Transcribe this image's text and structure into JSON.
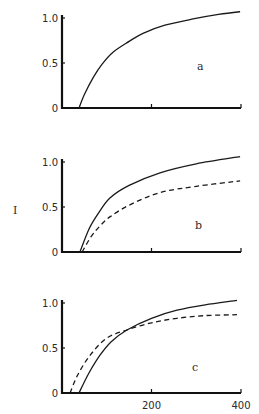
{
  "figure": {
    "y_axis_title": "I",
    "x_tick_labels": [
      "200",
      "400"
    ]
  },
  "chart_data": [
    {
      "type": "line",
      "panel": "a",
      "title": "",
      "xlabel": "",
      "ylabel": "I",
      "xlim": [
        0,
        400
      ],
      "ylim": [
        0,
        1.0
      ],
      "y_ticks": [
        "0",
        "0.5",
        "1.0"
      ],
      "x_ticks": [
        200,
        400
      ],
      "x_tick_labels_shown": false,
      "grid": false,
      "annotation": "a",
      "series": [
        {
          "name": "solid",
          "style": "solid",
          "x": [
            38,
            50,
            70,
            90,
            114,
            150,
            181,
            230,
            293,
            350,
            398
          ],
          "y": [
            0.0,
            0.15,
            0.34,
            0.49,
            0.62,
            0.74,
            0.83,
            0.92,
            0.99,
            1.04,
            1.07
          ]
        }
      ]
    },
    {
      "type": "line",
      "panel": "b",
      "title": "",
      "xlabel": "",
      "ylabel": "I",
      "xlim": [
        0,
        400
      ],
      "ylim": [
        0,
        1.0
      ],
      "y_ticks": [
        "0",
        "0.5",
        "1.0"
      ],
      "x_ticks": [
        200,
        400
      ],
      "x_tick_labels_shown": false,
      "grid": false,
      "annotation": "b",
      "series": [
        {
          "name": "solid",
          "style": "solid",
          "x": [
            40,
            60,
            80,
            107,
            150,
            219,
            300,
            398
          ],
          "y": [
            0.0,
            0.25,
            0.42,
            0.6,
            0.74,
            0.88,
            0.98,
            1.06
          ]
        },
        {
          "name": "dashed",
          "style": "dashed",
          "x": [
            45,
            65,
            85,
            107,
            150,
            219,
            300,
            398
          ],
          "y": [
            0.0,
            0.17,
            0.29,
            0.39,
            0.52,
            0.66,
            0.73,
            0.79
          ]
        }
      ]
    },
    {
      "type": "line",
      "panel": "c",
      "title": "",
      "xlabel": "",
      "ylabel": "I",
      "xlim": [
        0,
        400
      ],
      "ylim": [
        0,
        1.0
      ],
      "y_ticks": [
        "0",
        "0.5",
        "1.0"
      ],
      "x_ticks": [
        200,
        400
      ],
      "x_tick_labels_shown": true,
      "grid": false,
      "annotation": "c",
      "series": [
        {
          "name": "solid",
          "style": "solid",
          "x": [
            38,
            60,
            85,
            110,
            145,
            200,
            257,
            320,
            391
          ],
          "y": [
            0.0,
            0.22,
            0.42,
            0.57,
            0.7,
            0.83,
            0.92,
            0.98,
            1.03
          ]
        },
        {
          "name": "dashed",
          "style": "dashed",
          "x": [
            18,
            35,
            63,
            100,
            145,
            200,
            257,
            320,
            391
          ],
          "y": [
            0.0,
            0.2,
            0.42,
            0.61,
            0.7,
            0.78,
            0.83,
            0.86,
            0.87
          ]
        }
      ]
    }
  ]
}
